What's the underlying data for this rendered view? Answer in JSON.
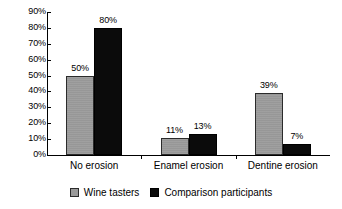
{
  "chart_data": {
    "type": "bar",
    "title": "",
    "subtitle": "",
    "xlabel": "",
    "ylabel": "",
    "categories": [
      "No erosion",
      "Enamel erosion",
      "Dentine erosion"
    ],
    "series": [
      {
        "name": "Wine tasters",
        "color": "#9a9a9a",
        "values": [
          50,
          11,
          39
        ],
        "labels": [
          "50%",
          "11%",
          "39%"
        ]
      },
      {
        "name": "Comparison participants",
        "color": "#0b0b0b",
        "values": [
          80,
          13,
          7
        ],
        "labels": [
          "80%",
          "13%",
          "7%"
        ]
      }
    ],
    "ylim": [
      0,
      90
    ],
    "ytick_values": [
      0,
      10,
      20,
      30,
      40,
      50,
      60,
      70,
      80,
      90
    ],
    "ytick_labels": [
      "0%",
      "10%",
      "20%",
      "30%",
      "40%",
      "50%",
      "60%",
      "70%",
      "80%",
      "90%"
    ],
    "grid": false,
    "legend_position": "bottom",
    "annotations": []
  },
  "axis": {
    "y": {
      "ticks": [
        {
          "value": 90,
          "label": "90%"
        },
        {
          "value": 80,
          "label": "80%"
        },
        {
          "value": 70,
          "label": "70%"
        },
        {
          "value": 60,
          "label": "60%"
        },
        {
          "value": 50,
          "label": "50%"
        },
        {
          "value": 40,
          "label": "40%"
        },
        {
          "value": 30,
          "label": "30%"
        },
        {
          "value": 20,
          "label": "20%"
        },
        {
          "value": 10,
          "label": "10%"
        },
        {
          "value": 0,
          "label": "0%"
        }
      ]
    },
    "x": {
      "categories": [
        "No erosion",
        "Enamel erosion",
        "Dentine erosion"
      ]
    }
  },
  "legend": {
    "items": [
      {
        "label": "Wine tasters",
        "color": "#9a9a9a"
      },
      {
        "label": "Comparison participants",
        "color": "#0b0b0b"
      }
    ]
  }
}
